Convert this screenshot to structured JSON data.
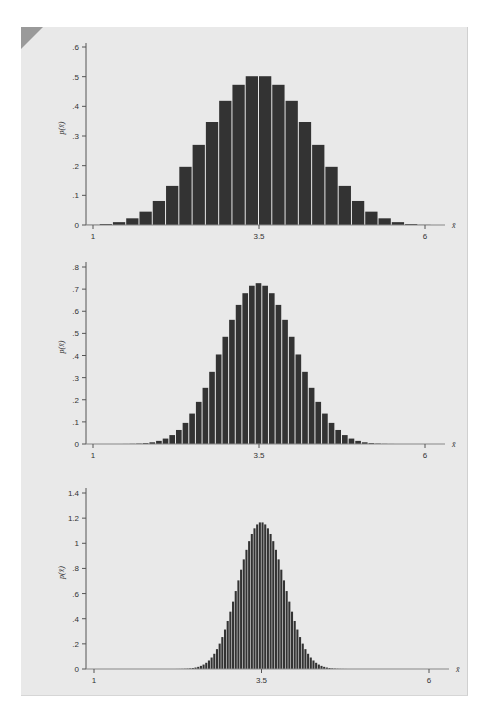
{
  "figure": {
    "panel_bg": "#e9e9e9",
    "bar_color": "#333333",
    "bar_gap_color": "#e9e9e9",
    "axis_color": "#555555"
  },
  "chart_data": [
    {
      "type": "bar",
      "title": "",
      "xlabel": "x̄",
      "ylabel": "p(x̄)",
      "bar_width": 0.2,
      "x_start": 1,
      "xticks": [
        "1",
        "3.5",
        "6"
      ],
      "xtick_values": [
        1,
        3.5,
        6
      ],
      "yticks": [
        "0",
        ".1",
        ".2",
        ".3",
        ".4",
        ".5",
        ".6"
      ],
      "ytick_values": [
        0,
        0.1,
        0.2,
        0.3,
        0.4,
        0.5,
        0.6
      ],
      "ylim": [
        0,
        0.6
      ],
      "xlim": [
        1,
        6
      ],
      "grid": false,
      "layout": {
        "axis_x": 86,
        "base_y": 225,
        "top_y": 43,
        "x1_px": 93,
        "x6_px": 425,
        "ytop_val": 0.6,
        "ytop_px": 47,
        "axis_end_x": 445
      },
      "values": [
        0.0006,
        0.0032,
        0.0096,
        0.0225,
        0.045,
        0.081,
        0.1318,
        0.1961,
        0.2701,
        0.3472,
        0.4186,
        0.4726,
        0.5015,
        0.5015,
        0.4726,
        0.4186,
        0.3472,
        0.2701,
        0.1961,
        0.1318,
        0.081,
        0.045,
        0.0225,
        0.0096,
        0.0032,
        0.0006
      ]
    },
    {
      "type": "bar",
      "title": "",
      "xlabel": "x̄",
      "ylabel": "p(x̄)",
      "bar_width": 0.1,
      "x_start": 1,
      "xticks": [
        "1",
        "3.5",
        "6"
      ],
      "xtick_values": [
        1,
        3.5,
        6
      ],
      "yticks": [
        "0",
        ".1",
        ".2",
        ".3",
        ".4",
        ".5",
        ".6",
        ".7",
        ".8"
      ],
      "ytick_values": [
        0,
        0.1,
        0.2,
        0.3,
        0.4,
        0.5,
        0.6,
        0.7,
        0.8
      ],
      "ylim": [
        0,
        0.8
      ],
      "xlim": [
        1,
        6
      ],
      "grid": false,
      "layout": {
        "axis_x": 86,
        "base_y": 444,
        "top_y": 262,
        "x1_px": 93,
        "x6_px": 425,
        "ytop_val": 0.8,
        "ytop_px": 267,
        "axis_end_x": 445
      },
      "values": [
        0.0,
        0.0,
        0.0,
        0.0,
        0.0001,
        0.0003,
        0.0008,
        0.0019,
        0.0039,
        0.0077,
        0.0141,
        0.0245,
        0.0403,
        0.0634,
        0.0954,
        0.1375,
        0.1904,
        0.2539,
        0.3262,
        0.4046,
        0.4846,
        0.5612,
        0.6287,
        0.6816,
        0.7153,
        0.7269,
        0.7153,
        0.6816,
        0.6287,
        0.5612,
        0.4846,
        0.4046,
        0.3262,
        0.2539,
        0.1904,
        0.1375,
        0.0954,
        0.0634,
        0.0403,
        0.0245,
        0.0141,
        0.0077,
        0.0039,
        0.0019,
        0.0008,
        0.0003,
        0.0001,
        0.0,
        0.0,
        0.0,
        0.0
      ]
    },
    {
      "type": "bar",
      "title": "",
      "xlabel": "x̄",
      "ylabel": "p(x̄)",
      "bar_width": 0.04,
      "x_start": 1,
      "xticks": [
        "1",
        "3.5",
        "6"
      ],
      "xtick_values": [
        1,
        3.5,
        6
      ],
      "yticks": [
        "0",
        ".2",
        ".4",
        ".6",
        ".8",
        "1",
        "1.2",
        "1.4"
      ],
      "ytick_values": [
        0,
        0.2,
        0.4,
        0.6,
        0.8,
        1.0,
        1.2,
        1.4
      ],
      "ylim": [
        0,
        1.4
      ],
      "xlim": [
        1,
        6
      ],
      "grid": false,
      "layout": {
        "axis_x": 86,
        "base_y": 669,
        "top_y": 488,
        "x1_px": 94,
        "x6_px": 429,
        "ytop_val": 1.4,
        "ytop_px": 493,
        "axis_end_x": 449
      },
      "values": [
        0,
        0,
        0,
        0,
        0,
        0,
        0,
        0,
        0,
        0,
        0,
        0,
        0,
        0,
        0,
        0,
        0,
        0,
        0,
        0,
        0,
        0,
        0,
        0,
        0,
        0,
        0,
        0,
        0,
        0,
        0.0003,
        0.0004,
        0.0007,
        0.0012,
        0.002,
        0.0032,
        0.005,
        0.0077,
        0.0116,
        0.0171,
        0.0248,
        0.0353,
        0.0493,
        0.0677,
        0.0913,
        0.121,
        0.158,
        0.202,
        0.254,
        0.314,
        0.382,
        0.456,
        0.536,
        0.62,
        0.705,
        0.79,
        0.872,
        0.948,
        1.017,
        1.074,
        1.119,
        1.15,
        1.166,
        1.166,
        1.15,
        1.119,
        1.074,
        1.017,
        0.948,
        0.872,
        0.79,
        0.705,
        0.62,
        0.536,
        0.456,
        0.382,
        0.314,
        0.254,
        0.202,
        0.158,
        0.121,
        0.0913,
        0.0677,
        0.0493,
        0.0353,
        0.0248,
        0.0171,
        0.0116,
        0.0077,
        0.005,
        0.0032,
        0.002,
        0.0012,
        0.0007,
        0.0004,
        0.0003,
        0,
        0,
        0,
        0,
        0,
        0,
        0,
        0,
        0,
        0,
        0,
        0,
        0,
        0,
        0,
        0,
        0,
        0,
        0,
        0,
        0,
        0,
        0,
        0,
        0,
        0,
        0,
        0,
        0,
        0
      ]
    }
  ]
}
